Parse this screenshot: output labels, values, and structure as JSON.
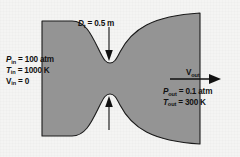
{
  "figure": {
    "name": "converging-diverging-nozzle-diagram",
    "background_color": "#f4f4f3",
    "nozzle_fill_color": "#949494",
    "nozzle_outline_color": "#1a1a1a",
    "text_color": "#111111"
  },
  "throat": {
    "symbol": "D",
    "subscript": "t",
    "equals": " = ",
    "value": "0.5 m",
    "full_text": "Dt = 0.5 m",
    "arrow_down_name": "throat-dimension-arrow-down",
    "arrow_up_name": "throat-dimension-arrow-up"
  },
  "inlet": {
    "pressure": {
      "symbol": "P",
      "subscript": "in",
      "equals": " = ",
      "value": "100 atm",
      "full_text": "Pin = 100 atm"
    },
    "temperature": {
      "symbol": "T",
      "subscript": "in",
      "equals": " = ",
      "value": "1000 K",
      "full_text": "Tin = 1000 K"
    },
    "velocity": {
      "symbol": "V",
      "subscript": "in",
      "equals": " = ",
      "value": "0",
      "full_text": "Vin = 0"
    }
  },
  "outlet": {
    "velocity": {
      "symbol": "V",
      "subscript": "out",
      "full_text": "Vout"
    },
    "pressure": {
      "symbol": "P",
      "subscript": "out",
      "equals": " = ",
      "value": "0.1 atm",
      "full_text": "Pout = 0.1 atm"
    },
    "temperature": {
      "symbol": "T",
      "subscript": "out",
      "equals": " = ",
      "value": "300 K",
      "full_text": "Tout = 300 K"
    },
    "flow_arrow_name": "outlet-flow-arrow"
  }
}
